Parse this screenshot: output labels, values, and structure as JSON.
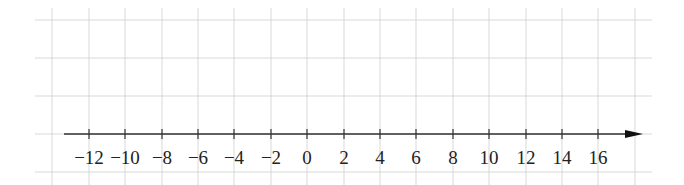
{
  "figure": {
    "type": "number-line",
    "colors": {
      "background": "#ffffff",
      "grid": "#cfcfcf",
      "axis": "#333333",
      "text": "#222222"
    },
    "grid": {
      "x_lines": [
        52,
        89,
        125,
        162,
        198,
        234,
        271,
        307,
        344,
        380,
        416,
        453,
        489,
        526,
        562,
        598,
        635
      ],
      "y_lines": [
        20,
        58,
        96,
        172
      ],
      "x_extent": [
        35,
        652
      ],
      "y_extent": [
        8,
        185
      ]
    },
    "axis": {
      "y": 134,
      "x_start": 64,
      "x_end": 643,
      "arrow": "right"
    },
    "ticks": [
      {
        "value": -12,
        "label": "−12",
        "x": 89
      },
      {
        "value": -10,
        "label": "−10",
        "x": 125
      },
      {
        "value": -8,
        "label": "−8",
        "x": 162
      },
      {
        "value": -6,
        "label": "−6",
        "x": 198
      },
      {
        "value": -4,
        "label": "−4",
        "x": 234
      },
      {
        "value": -2,
        "label": "−2",
        "x": 271
      },
      {
        "value": 0,
        "label": "0",
        "x": 307
      },
      {
        "value": 2,
        "label": "2",
        "x": 344
      },
      {
        "value": 4,
        "label": "4",
        "x": 380
      },
      {
        "value": 6,
        "label": "6",
        "x": 416
      },
      {
        "value": 8,
        "label": "8",
        "x": 453
      },
      {
        "value": 10,
        "label": "10",
        "x": 489
      },
      {
        "value": 12,
        "label": "12",
        "x": 526
      },
      {
        "value": 14,
        "label": "14",
        "x": 562
      },
      {
        "value": 16,
        "label": "16",
        "x": 598
      }
    ],
    "label_y": 164,
    "label_font_size": 19
  }
}
